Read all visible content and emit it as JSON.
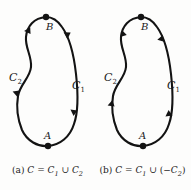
{
  "figure": {
    "stroke_color": "#131313",
    "background_color": "#fdfdfc",
    "panels": [
      {
        "id": "a",
        "tag": "(a)",
        "caption_full": "(a) C = C1 ∪ C2",
        "caption_parts": {
          "tag": "(a)",
          "c": "C",
          "equals": "=",
          "c1": "C",
          "c1_sub": "1",
          "union": "∪",
          "c2": "C",
          "c2_sub": "2",
          "open_paren": "",
          "minus": "",
          "close_paren": ""
        },
        "points": [
          {
            "name": "B",
            "label": "B",
            "position": "top"
          },
          {
            "name": "A",
            "label": "A",
            "position": "bottom"
          }
        ],
        "arcs": [
          {
            "name": "C2",
            "label": "C",
            "sub": "2",
            "side": "left",
            "direction": "downward"
          },
          {
            "name": "C1",
            "label": "C",
            "sub": "1",
            "side": "right",
            "direction": "downward"
          }
        ],
        "orientation": "C1 traversed A to B, C2 traversed B to A"
      },
      {
        "id": "b",
        "tag": "(b)",
        "caption_full": "(b) C = C1 ∪ (−C2)",
        "caption_parts": {
          "tag": "(b)",
          "c": "C",
          "equals": "=",
          "c1": "C",
          "c1_sub": "1",
          "union": "∪",
          "c2": "C",
          "c2_sub": "2",
          "open_paren": "(",
          "minus": "−",
          "close_paren": ")"
        },
        "points": [
          {
            "name": "B",
            "label": "B",
            "position": "top"
          },
          {
            "name": "A",
            "label": "A",
            "position": "bottom"
          }
        ],
        "arcs": [
          {
            "name": "C2",
            "label": "C",
            "sub": "2",
            "side": "left",
            "direction": "upward"
          },
          {
            "name": "C1",
            "label": "C",
            "sub": "1",
            "side": "right",
            "direction": "upward"
          }
        ],
        "orientation": "both arcs traversed A to B"
      }
    ]
  }
}
